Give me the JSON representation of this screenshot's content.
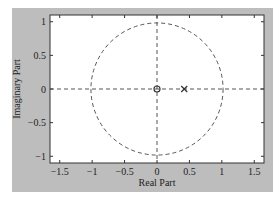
{
  "chart_data": {
    "type": "scatter",
    "title": "",
    "xlabel": "Real Part",
    "ylabel": "Imaginary Part",
    "xlim": [
      -1.65,
      1.65
    ],
    "ylim": [
      -1.1,
      1.1
    ],
    "xticks": [
      -1.5,
      -1,
      -0.5,
      0,
      0.5,
      1,
      1.5
    ],
    "xtick_labels": [
      "-1.5",
      "-1",
      "-0.5",
      "0",
      "0.5",
      "1",
      "1.5"
    ],
    "yticks": [
      -1,
      -0.5,
      0,
      0.5,
      1
    ],
    "ytick_labels": [
      "-1",
      "-0.5",
      "0",
      "0.5",
      "1"
    ],
    "grid": false,
    "legend": null,
    "unit_circle": {
      "center": [
        0,
        0
      ],
      "radius": 1,
      "style": "dashed"
    },
    "reference_lines": [
      {
        "orientation": "horizontal",
        "value": 0,
        "style": "dashed"
      },
      {
        "orientation": "vertical",
        "value": 0,
        "style": "dashed"
      }
    ],
    "series": [
      {
        "name": "zeros",
        "marker": "o",
        "x": [
          0
        ],
        "y": [
          0
        ]
      },
      {
        "name": "poles",
        "marker": "x",
        "x": [
          0.42
        ],
        "y": [
          0
        ]
      }
    ]
  },
  "colors": {
    "figure_background": "#bdbdbd",
    "axes_background": "#ffffff",
    "line": "#444444"
  }
}
